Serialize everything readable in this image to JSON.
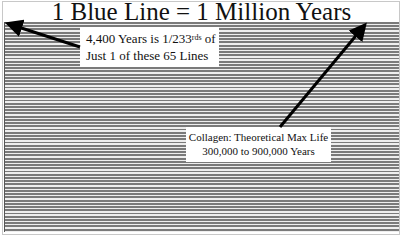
{
  "title": "1 Blue Line = 1 Million Years",
  "notes": [
    {
      "line1_prefix": "4,400 Years is 1/233",
      "line1_superscript": "rds",
      "line1_suffix": " of",
      "line2": "Just 1 of these 65 Lines"
    },
    {
      "line1": "Collagen: Theoretical Max Life",
      "line2": "300,000 to 900,000 Years"
    }
  ],
  "lines": {
    "count": 65,
    "line_color": "#7a7a7a",
    "gap_color": "#eeeeee"
  },
  "arrows": [
    {
      "name": "arrow-to-first-line",
      "from": [
        80,
        47
      ],
      "to": [
        7,
        23
      ],
      "color": "#000000"
    },
    {
      "name": "arrow-to-top-right-line",
      "from": [
        280,
        127
      ],
      "to": [
        366,
        23
      ],
      "color": "#000000"
    }
  ]
}
